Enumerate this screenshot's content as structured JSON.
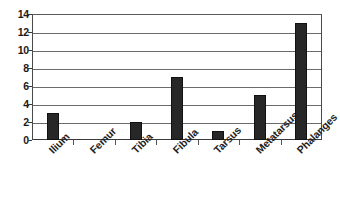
{
  "chart_data": {
    "type": "bar",
    "title": "",
    "xlabel": "",
    "ylabel": "",
    "categories": [
      "Ilium",
      "Femur",
      "Tibia",
      "Fibula",
      "Tarsus",
      "Metatarsus",
      "Phalanges"
    ],
    "values": [
      3,
      0,
      2,
      7,
      1,
      5,
      13
    ],
    "ylim": [
      0,
      14
    ],
    "yticks": [
      0,
      2,
      4,
      6,
      8,
      10,
      12,
      14
    ],
    "ytick_labels": [
      "0",
      "2",
      "4",
      "6",
      "8",
      "10",
      "12",
      "14"
    ],
    "grid": "horizontal",
    "legend": "none",
    "bar_color": "#272727",
    "grid_color": "#6b6b6b",
    "axis_color": "#3a3a3a",
    "background": "#ffffff",
    "label_rotation_deg": -45
  }
}
